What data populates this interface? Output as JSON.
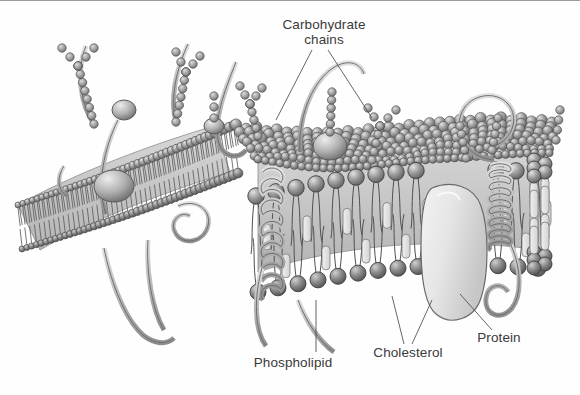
{
  "figure": {
    "style": "grayscale pen-and-ink textbook illustration",
    "background_color": "#fefefe",
    "ink_color": "#3a3a3a",
    "width": 580,
    "height": 395
  },
  "labels": {
    "carbohydrate": "Carbohydrate\nchains",
    "phospholipid": "Phospholipid",
    "cholesterol": "Cholesterol",
    "protein": "Protein"
  },
  "structures": {
    "bilayer": {
      "name": "phospholipid bilayer",
      "head_color": "#8d8d8d",
      "tail_color": "#6f6f6f",
      "core_color": "#cfcfcf"
    },
    "integral_protein": {
      "name": "integral membrane protein",
      "fill": "#e4e4e4",
      "stroke": "#6a6a6a"
    },
    "cholesterol_block": {
      "name": "cholesterol molecule",
      "fill": "#e8e8e8",
      "stroke": "#7a7a7a"
    },
    "carbohydrate_bead": {
      "name": "carbohydrate sugar bead",
      "fill": "#a6a6a6",
      "stroke": "#5e5e5e"
    },
    "peripheral_protein": {
      "name": "peripheral protein strand",
      "fill": "#c8c8c8",
      "stroke": "#6a6a6a"
    },
    "glycolipid_head": {
      "name": "glycolipid globular head",
      "fill": "#b8b8b8",
      "stroke": "#5a5a5a"
    }
  },
  "leader_lines": {
    "carbohydrate": "two-branch V from label down to two carbohydrate chains",
    "phospholipid": "single vertical line up to a phospholipid head group",
    "cholesterol": "two-branch narrow V up into the bilayer interior",
    "protein": "single diagonal line up-left to the integral protein"
  }
}
